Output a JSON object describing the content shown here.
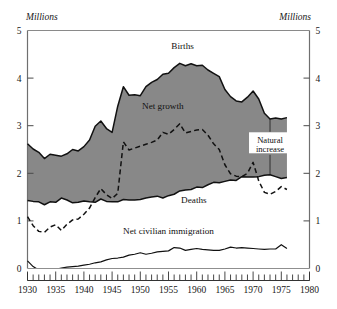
{
  "chart_data": {
    "type": "area",
    "title": "",
    "subtitle": "",
    "xlabel": "",
    "ylabel": "",
    "y_unit_label_left": "Millions",
    "y_unit_label_right": "Millions",
    "xlim": [
      1930,
      1980
    ],
    "ylim": [
      0,
      5
    ],
    "grid": false,
    "legend_position": "inline-annotations",
    "x_major_ticks": [
      1930,
      1935,
      1940,
      1945,
      1950,
      1955,
      1960,
      1965,
      1970,
      1975,
      1980
    ],
    "x_tick_labels": [
      "1930",
      "1935",
      "1940",
      "1945",
      "1950",
      "1955",
      "1960",
      "1965",
      "1970",
      "1975",
      "1980"
    ],
    "x_minor_tick_interval": 1,
    "y_major_ticks": [
      0,
      1,
      2,
      3,
      4,
      5
    ],
    "y_tick_labels_left": [
      "0",
      "1",
      "2",
      "3",
      "4",
      "5"
    ],
    "y_tick_labels_right": [
      "0",
      "1",
      "2",
      "3",
      "4",
      "5"
    ],
    "shaded_band": {
      "name": "Natural increase",
      "upper_series": "Births",
      "lower_series": "Deaths",
      "fill_color": "#888888"
    },
    "x": [
      1930,
      1931,
      1932,
      1933,
      1934,
      1935,
      1936,
      1937,
      1938,
      1939,
      1940,
      1941,
      1942,
      1943,
      1944,
      1945,
      1946,
      1947,
      1948,
      1949,
      1950,
      1951,
      1952,
      1953,
      1954,
      1955,
      1956,
      1957,
      1958,
      1959,
      1960,
      1961,
      1962,
      1963,
      1964,
      1965,
      1966,
      1967,
      1968,
      1969,
      1970,
      1971,
      1972,
      1973,
      1974,
      1975,
      1976
    ],
    "series": [
      {
        "name": "Births",
        "style": "solid",
        "color": "#111111",
        "values": [
          2.62,
          2.51,
          2.44,
          2.31,
          2.4,
          2.38,
          2.36,
          2.41,
          2.5,
          2.47,
          2.56,
          2.7,
          2.99,
          3.1,
          2.94,
          2.86,
          3.41,
          3.82,
          3.64,
          3.65,
          3.63,
          3.82,
          3.91,
          3.97,
          4.08,
          4.1,
          4.22,
          4.31,
          4.26,
          4.3,
          4.26,
          4.27,
          4.17,
          4.1,
          4.03,
          3.76,
          3.61,
          3.52,
          3.5,
          3.6,
          3.73,
          3.56,
          3.26,
          3.14,
          3.16,
          3.14,
          3.17
        ]
      },
      {
        "name": "Deaths",
        "style": "solid",
        "color": "#111111",
        "values": [
          1.43,
          1.41,
          1.4,
          1.34,
          1.4,
          1.39,
          1.48,
          1.44,
          1.38,
          1.39,
          1.42,
          1.4,
          1.39,
          1.46,
          1.41,
          1.4,
          1.4,
          1.45,
          1.44,
          1.44,
          1.45,
          1.48,
          1.5,
          1.52,
          1.48,
          1.53,
          1.56,
          1.63,
          1.65,
          1.66,
          1.71,
          1.7,
          1.76,
          1.81,
          1.8,
          1.83,
          1.86,
          1.85,
          1.93,
          1.92,
          1.92,
          1.93,
          1.96,
          1.97,
          1.93,
          1.89,
          1.91
        ]
      },
      {
        "name": "Net growth",
        "style": "dashed",
        "color": "#111111",
        "values": [
          1.09,
          0.9,
          0.78,
          0.76,
          0.87,
          0.92,
          0.8,
          0.93,
          1.02,
          1.04,
          1.14,
          1.27,
          1.49,
          1.68,
          1.55,
          1.47,
          1.58,
          2.66,
          2.49,
          2.53,
          2.57,
          2.61,
          2.65,
          2.7,
          2.86,
          2.82,
          2.92,
          3.04,
          2.85,
          2.88,
          2.91,
          2.92,
          2.8,
          2.62,
          2.5,
          2.18,
          1.99,
          1.94,
          1.93,
          2.0,
          2.23,
          1.84,
          1.6,
          1.56,
          1.62,
          1.72,
          1.66
        ]
      },
      {
        "name": "Net civilian immigration",
        "style": "solid",
        "color": "#111111",
        "values": [
          0.16,
          0.04,
          -0.03,
          -0.06,
          -0.05,
          -0.02,
          0.01,
          0.03,
          0.04,
          0.05,
          0.07,
          0.09,
          0.12,
          0.14,
          0.18,
          0.21,
          0.22,
          0.24,
          0.28,
          0.3,
          0.33,
          0.3,
          0.32,
          0.35,
          0.36,
          0.37,
          0.44,
          0.43,
          0.38,
          0.4,
          0.42,
          0.4,
          0.39,
          0.38,
          0.38,
          0.41,
          0.45,
          0.43,
          0.44,
          0.43,
          0.42,
          0.41,
          0.4,
          0.41,
          0.41,
          0.5,
          0.42
        ]
      }
    ],
    "annotations": [
      {
        "name": "births-label",
        "text": "Births",
        "x": 1957.5,
        "y": 4.68
      },
      {
        "name": "net-growth-label",
        "text": "Net growth",
        "x": 1954.0,
        "y": 3.42
      },
      {
        "name": "deaths-label",
        "text": "Deaths",
        "x": 1959.5,
        "y": 1.44
      },
      {
        "name": "net-civilian-immigration-label",
        "text": "Net civilian immigration",
        "x": 1955.0,
        "y": 0.8
      },
      {
        "name": "natural-increase-label",
        "text": "Natural increase",
        "line1": "Natural",
        "line2": "increase",
        "x": 1973.0,
        "y": 2.62
      }
    ]
  },
  "colors": {
    "band_fill": "#888888",
    "stroke": "#111111",
    "frame": "#7a7a7a",
    "background": "#ffffff",
    "text": "#181818"
  }
}
